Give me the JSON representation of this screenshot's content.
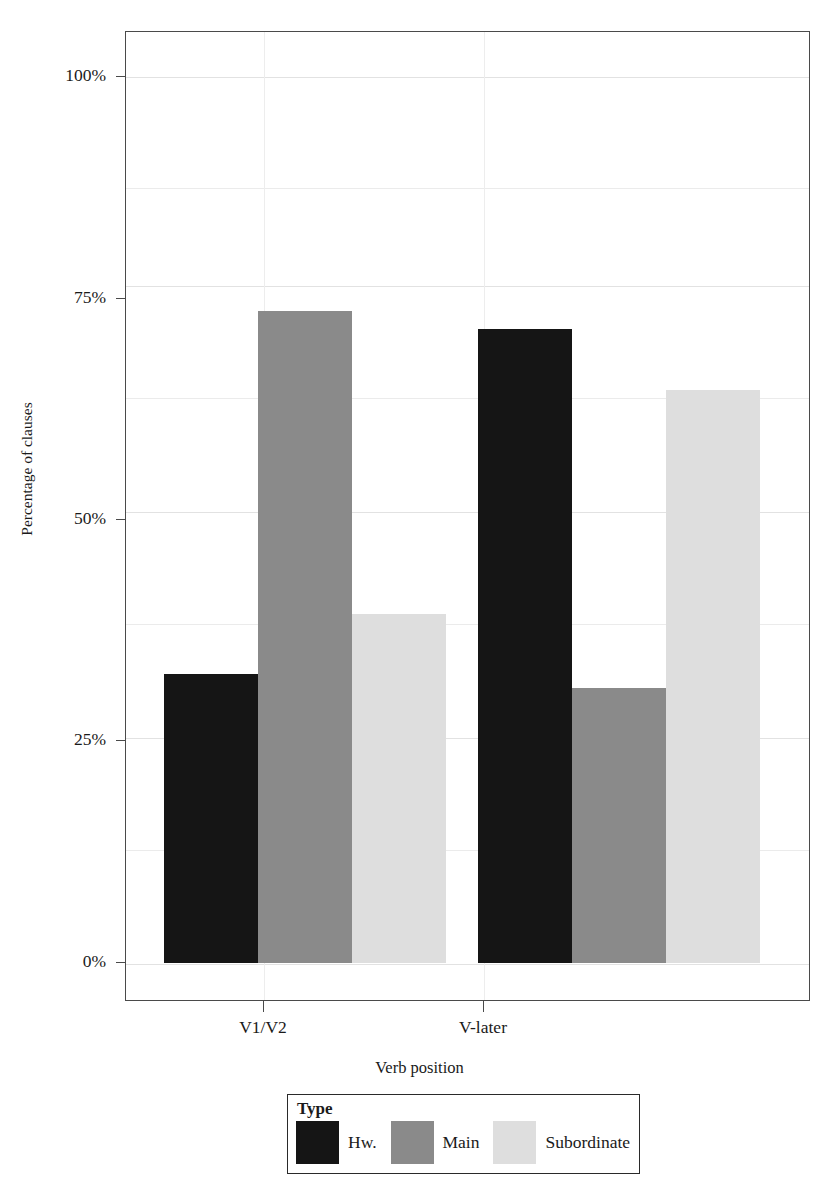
{
  "chart_data": {
    "type": "bar",
    "title": "",
    "xlabel": "Verb position",
    "ylabel": "Percentage of clauses",
    "categories": [
      "V1/V2",
      "V-later"
    ],
    "ylim": [
      0,
      100
    ],
    "ytick_labels": [
      "0%",
      "25%",
      "50%",
      "75%",
      "100%"
    ],
    "ytick_values": [
      0,
      25,
      50,
      75,
      100
    ],
    "grid": true,
    "grid_minor_values": [
      12.5,
      37.5,
      62.5,
      87.5
    ],
    "legend_position": "bottom",
    "legend_title": "Type",
    "series": [
      {
        "name": "Hw.",
        "color": "#151515",
        "values": [
          31.0,
          68.0
        ]
      },
      {
        "name": "Main",
        "color": "#8a8a8a",
        "values": [
          70.0,
          29.5
        ]
      },
      {
        "name": "Subordinate",
        "color": "#dedede",
        "values": [
          37.5,
          61.5
        ]
      }
    ]
  },
  "axes": {
    "y_title": "Percentage of clauses",
    "x_title": "Verb position",
    "y_labels": [
      "100%",
      "75%",
      "50%",
      "25%",
      "0%"
    ],
    "x_labels": [
      "V1/V2",
      "V-later"
    ]
  },
  "legend": {
    "title": "Type",
    "entries": [
      {
        "label": "Hw.",
        "color": "#151515"
      },
      {
        "label": "Main",
        "color": "#8a8a8a"
      },
      {
        "label": "Subordinate",
        "color": "#dedede"
      }
    ]
  },
  "colors": {
    "frame": "#4a4a4a",
    "grid": "#ebebeb",
    "background": "#ffffff"
  }
}
